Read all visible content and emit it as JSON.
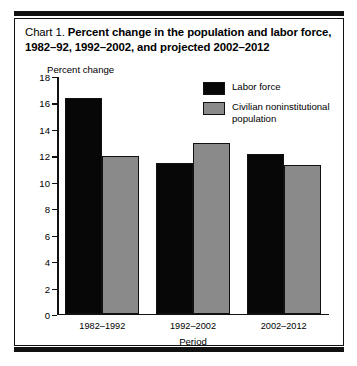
{
  "figure": {
    "title_number": "Chart 1.",
    "title_text": "Percent change in the population and labor force, 1982–92, 1992–2002, and projected 2002–2012"
  },
  "colors": {
    "labor_force": "#070707",
    "civilian_population": "#8a8a8a",
    "frame": "#111111",
    "background": "#ffffff"
  },
  "chart_data": {
    "type": "bar",
    "title": "Chart 1.  Percent change in the population and labor force, 1982–92, 1992–2002, and projected 2002–2012",
    "categories": [
      "1982–1992",
      "1992–2002",
      "2002–2012"
    ],
    "series": [
      {
        "name": "Labor force",
        "values": [
          16.3,
          11.4,
          12.1
        ]
      },
      {
        "name": "Civilian noninstitutional population",
        "values": [
          11.9,
          12.9,
          11.2
        ]
      }
    ],
    "xlabel": "Period",
    "ylabel": "Percent change",
    "ylim": [
      0,
      18
    ],
    "yticks": [
      0,
      2,
      4,
      6,
      8,
      10,
      12,
      14,
      16,
      18
    ],
    "ytick_labels": [
      "0",
      "2",
      "4",
      "6",
      "8",
      "10",
      "12",
      "14",
      "16",
      "18"
    ],
    "grid": false,
    "legend_position": "upper right"
  }
}
